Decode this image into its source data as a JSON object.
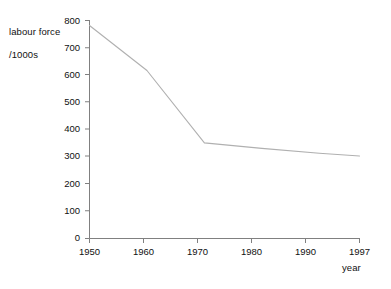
{
  "chart_data": {
    "type": "line",
    "title": "",
    "subtitle": "",
    "xlabel": "year",
    "ylabel": "labour force\n/1000s",
    "ylabel_line1": "labour force",
    "ylabel_line2": "/1000s",
    "x": [
      1950,
      1960,
      1970,
      1980,
      1990,
      1997
    ],
    "values": [
      780,
      615,
      350,
      330,
      312,
      302
    ],
    "series": [
      {
        "name": "labour force",
        "values": [
          780,
          615,
          350,
          330,
          312,
          302
        ]
      }
    ],
    "xlim": [
      1950,
      1997
    ],
    "ylim": [
      0,
      800
    ],
    "xticks": [
      1950,
      1960,
      1970,
      1980,
      1990,
      1997
    ],
    "yticks": [
      0,
      100,
      200,
      300,
      400,
      500,
      600,
      700,
      800
    ],
    "xtick_labels": [
      "1950",
      "1960",
      "1970",
      "1980",
      "1990",
      "1997"
    ],
    "ytick_labels": [
      "0",
      "100",
      "200",
      "300",
      "400",
      "500",
      "600",
      "700",
      "800"
    ],
    "grid": false,
    "legend": false,
    "legend_position": "none",
    "line_color": "#b0b0b0",
    "axis_color": "#808080",
    "background_color": "#ffffff",
    "text_color": "#111111"
  }
}
